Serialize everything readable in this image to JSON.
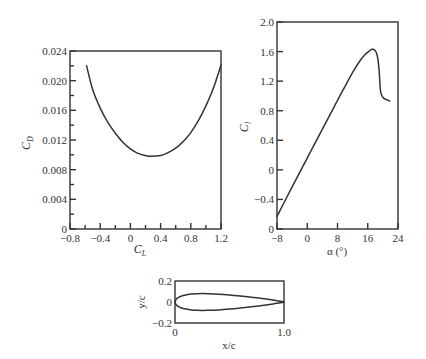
{
  "chart_data": [
    {
      "id": "drag_polar",
      "type": "line",
      "title": "",
      "xlabel": "C_L",
      "ylabel": "C_D",
      "xlim": [
        -0.8,
        1.2
      ],
      "ylim": [
        0,
        0.024
      ],
      "grid": false,
      "legend": null,
      "x_ticks": [
        -0.8,
        -0.4,
        0,
        0.4,
        0.8,
        1.2
      ],
      "x_tick_labels": [
        "−0.8",
        "−0.4",
        "0",
        "0.4",
        "0.8",
        "1.2"
      ],
      "x_minor_ticks": [
        -0.6,
        -0.2,
        0.2,
        0.6,
        1.0
      ],
      "y_ticks": [
        0,
        0.004,
        0.008,
        0.012,
        0.016,
        0.02,
        0.024
      ],
      "y_tick_labels": [
        "0",
        "0.004",
        "0.008",
        "0.012",
        "0.016",
        "0.020",
        "0.024"
      ],
      "y_minor_ticks": [
        0.002,
        0.006,
        0.01,
        0.014,
        0.018,
        0.022
      ],
      "series": [
        {
          "name": "C_D vs C_L",
          "x": [
            -0.58,
            -0.5,
            -0.4,
            -0.3,
            -0.2,
            -0.1,
            0.0,
            0.1,
            0.2,
            0.27,
            0.4,
            0.5,
            0.6,
            0.7,
            0.8,
            0.9,
            1.0,
            1.1,
            1.2
          ],
          "y": [
            0.022,
            0.0188,
            0.0163,
            0.0144,
            0.0129,
            0.0117,
            0.0108,
            0.0102,
            0.0099,
            0.0098,
            0.0099,
            0.0103,
            0.0109,
            0.0118,
            0.013,
            0.0146,
            0.0166,
            0.019,
            0.0221
          ]
        }
      ]
    },
    {
      "id": "lift_curve",
      "type": "line",
      "title": "",
      "xlabel": "α (°)",
      "ylabel": "C_l",
      "xlim": [
        -8,
        24
      ],
      "ylim": [
        -0.8,
        2.0
      ],
      "grid": false,
      "legend": null,
      "x_ticks": [
        -8,
        0,
        8,
        16,
        24
      ],
      "x_tick_labels": [
        "−8",
        "0",
        "8",
        "16",
        "24"
      ],
      "y_ticks": [
        -0.8,
        -0.4,
        0,
        0.4,
        0.8,
        1.2,
        1.6,
        2.0
      ],
      "y_tick_labels": [
        "0",
        "−0.4",
        "0",
        "0.4",
        "0.8",
        "1.2",
        "1.6",
        "2.0"
      ],
      "series": [
        {
          "name": "C_l vs α",
          "x": [
            -8,
            -4,
            0,
            4,
            8,
            10,
            12,
            14,
            15.5,
            16.5,
            17.1,
            17.8,
            18.5,
            19.0,
            19.3,
            19.6,
            20.2,
            21.0,
            21.8
          ],
          "y": [
            -0.63,
            -0.23,
            0.16,
            0.55,
            0.94,
            1.13,
            1.32,
            1.48,
            1.57,
            1.61,
            1.63,
            1.62,
            1.55,
            1.35,
            1.1,
            1.02,
            0.97,
            0.95,
            0.93
          ]
        }
      ]
    },
    {
      "id": "airfoil_shape",
      "type": "line",
      "title": "",
      "xlabel": "x/c",
      "ylabel": "y/c",
      "xlim": [
        0,
        1.0
      ],
      "ylim": [
        -0.2,
        0.2
      ],
      "grid": false,
      "legend": null,
      "x_ticks": [
        0,
        1.0
      ],
      "x_tick_labels": [
        "0",
        "1.0"
      ],
      "y_ticks": [
        -0.2,
        0,
        0.2
      ],
      "y_tick_labels": [
        "−0.2",
        "0",
        "0.2"
      ],
      "series": [
        {
          "name": "upper surface",
          "x": [
            0,
            0.0125,
            0.025,
            0.05,
            0.075,
            0.1,
            0.15,
            0.2,
            0.25,
            0.3,
            0.4,
            0.5,
            0.6,
            0.7,
            0.8,
            0.9,
            0.95,
            1.0
          ],
          "y": [
            0,
            0.0284,
            0.039,
            0.0527,
            0.0616,
            0.0677,
            0.0756,
            0.079,
            0.08,
            0.0792,
            0.075,
            0.0675,
            0.0575,
            0.046,
            0.0327,
            0.018,
            0.0098,
            0.0019
          ]
        },
        {
          "name": "lower surface",
          "x": [
            0,
            0.0125,
            0.025,
            0.05,
            0.075,
            0.1,
            0.15,
            0.2,
            0.25,
            0.3,
            0.4,
            0.5,
            0.6,
            0.7,
            0.8,
            0.9,
            0.95,
            1.0
          ],
          "y": [
            0,
            -0.0284,
            -0.039,
            -0.0527,
            -0.0616,
            -0.0677,
            -0.0756,
            -0.079,
            -0.08,
            -0.0792,
            -0.075,
            -0.0675,
            -0.0575,
            -0.046,
            -0.0327,
            -0.018,
            -0.0098,
            -0.0019
          ]
        }
      ]
    }
  ],
  "layout": {
    "drag_polar": {
      "left": 70,
      "top": 51,
      "right": 221,
      "bottom": 229
    },
    "lift_curve": {
      "left": 277,
      "top": 22,
      "right": 398,
      "bottom": 229
    },
    "airfoil_shape": {
      "left": 175,
      "top": 281,
      "right": 284,
      "bottom": 323
    }
  },
  "labels": {
    "drag_polar_xlabel_main": "C",
    "drag_polar_xlabel_sub": "L",
    "drag_polar_ylabel_main": "C",
    "drag_polar_ylabel_sub": "D",
    "lift_curve_xlabel": "α (°)",
    "lift_curve_ylabel_main": "C",
    "lift_curve_ylabel_sub": "l",
    "airfoil_xlabel": "x/c",
    "airfoil_ylabel": "y/c"
  }
}
